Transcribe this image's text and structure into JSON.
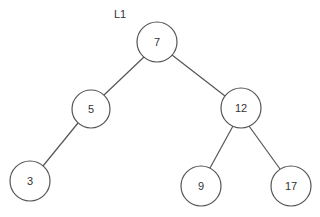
{
  "diagram": {
    "type": "binary-search-tree",
    "label": "L1",
    "nodes": [
      {
        "id": "n7",
        "value": "7",
        "cx": 157,
        "cy": 42,
        "r": 20
      },
      {
        "id": "n5",
        "value": "5",
        "cx": 91,
        "cy": 109,
        "r": 19
      },
      {
        "id": "n12",
        "value": "12",
        "cx": 241,
        "cy": 108,
        "r": 20
      },
      {
        "id": "n3",
        "value": "3",
        "cx": 30,
        "cy": 181,
        "r": 20
      },
      {
        "id": "n9",
        "value": "9",
        "cx": 201,
        "cy": 186,
        "r": 20
      },
      {
        "id": "n17",
        "value": "17",
        "cx": 291,
        "cy": 186,
        "r": 20
      }
    ],
    "edges": [
      {
        "from": "7",
        "to": "5"
      },
      {
        "from": "7",
        "to": "12"
      },
      {
        "from": "5",
        "to": "3"
      },
      {
        "from": "12",
        "to": "9"
      },
      {
        "from": "12",
        "to": "17"
      }
    ],
    "colors": {
      "stroke": "#555555",
      "text": "#333333",
      "background": "#ffffff"
    }
  }
}
